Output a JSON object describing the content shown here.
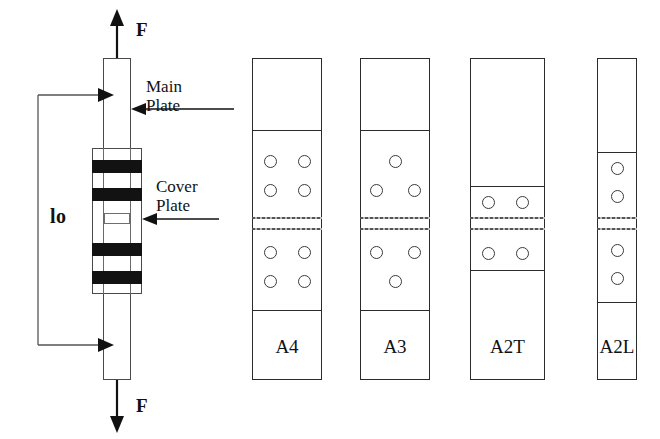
{
  "figure": {
    "background_color": "#ffffff",
    "line_color": "#2b2b2b"
  },
  "assembly": {
    "name": "splice-joint-assembly",
    "force_top_label": "F",
    "force_bottom_label": "F",
    "gauge_length_label": "lo",
    "callouts": [
      {
        "id": "main-plate",
        "line1": "Main",
        "line2": "Plate"
      },
      {
        "id": "cover-plate",
        "line1": "Cover",
        "line2": "Plate"
      }
    ],
    "main_plate": {
      "x": 103,
      "y": 58,
      "width": 28,
      "height": 322
    },
    "cover_plate": {
      "x": 92,
      "y": 148,
      "width": 50,
      "height": 146
    },
    "bolt_bands": [
      {
        "y": 160,
        "height": 13
      },
      {
        "y": 188,
        "height": 13
      },
      {
        "y": 243,
        "height": 13
      },
      {
        "y": 271,
        "height": 13
      }
    ],
    "dimension": {
      "left_x": 38,
      "top_y": 95,
      "bottom_y": 345,
      "arrow_x": 112
    }
  },
  "specimens": [
    {
      "id": "A4",
      "label": "A4",
      "hole_count_per_side": 4,
      "pattern": "2x2-grid",
      "x": 252,
      "y": 58,
      "width": 70,
      "height": 322,
      "plate_top_y": 130,
      "plate_bottom_y": 310,
      "joint_line1_y": 217,
      "joint_line2_y": 228,
      "holes_top": [
        {
          "cx": 18,
          "cy": 161
        },
        {
          "cx": 52,
          "cy": 161
        },
        {
          "cx": 18,
          "cy": 190
        },
        {
          "cx": 52,
          "cy": 190
        }
      ],
      "holes_bottom": [
        {
          "cx": 18,
          "cy": 252
        },
        {
          "cx": 52,
          "cy": 252
        },
        {
          "cx": 18,
          "cy": 281
        },
        {
          "cx": 52,
          "cy": 281
        }
      ]
    },
    {
      "id": "A3",
      "label": "A3",
      "hole_count_per_side": 3,
      "pattern": "triangular",
      "x": 360,
      "y": 58,
      "width": 70,
      "height": 322,
      "plate_top_y": 130,
      "plate_bottom_y": 310,
      "joint_line1_y": 217,
      "joint_line2_y": 228,
      "holes_top": [
        {
          "cx": 35,
          "cy": 161
        },
        {
          "cx": 16,
          "cy": 190
        },
        {
          "cx": 54,
          "cy": 190
        }
      ],
      "holes_bottom": [
        {
          "cx": 16,
          "cy": 252
        },
        {
          "cx": 54,
          "cy": 252
        },
        {
          "cx": 35,
          "cy": 281
        }
      ]
    },
    {
      "id": "A2T",
      "label": "A2T",
      "hole_count_per_side": 2,
      "pattern": "transverse-pair",
      "x": 470,
      "y": 58,
      "width": 75,
      "height": 322,
      "plate_top_y": 186,
      "plate_bottom_y": 270,
      "joint_line1_y": 217,
      "joint_line2_y": 228,
      "holes_top": [
        {
          "cx": 18,
          "cy": 202
        },
        {
          "cx": 52,
          "cy": 202
        }
      ],
      "holes_bottom": [
        {
          "cx": 18,
          "cy": 253
        },
        {
          "cx": 52,
          "cy": 253
        }
      ]
    },
    {
      "id": "A2L",
      "label": "A2L",
      "hole_count_per_side": 2,
      "pattern": "longitudinal-pair",
      "x": 597,
      "y": 58,
      "width": 40,
      "height": 322,
      "plate_top_y": 152,
      "plate_bottom_y": 302,
      "joint_line1_y": 217,
      "joint_line2_y": 228,
      "holes_top": [
        {
          "cx": 20,
          "cy": 168
        },
        {
          "cx": 20,
          "cy": 196
        }
      ],
      "holes_bottom": [
        {
          "cx": 20,
          "cy": 250
        },
        {
          "cx": 20,
          "cy": 278
        }
      ]
    }
  ]
}
